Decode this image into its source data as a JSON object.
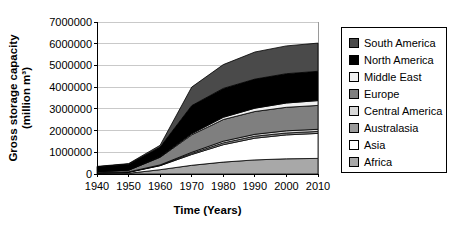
{
  "labels": {
    "y_title_line1": "Gross storage capacity",
    "y_title_line2": "(million m³)",
    "x_title": "Time (Years)"
  },
  "legend": {
    "position": "right",
    "items": [
      {
        "label": "South America",
        "color": "#4a4a4a"
      },
      {
        "label": "North America",
        "color": "#000000"
      },
      {
        "label": "Middle East",
        "color": "#f0f0f0"
      },
      {
        "label": "Europe",
        "color": "#7f7f7f"
      },
      {
        "label": "Central America",
        "color": "#d8d8d8"
      },
      {
        "label": "Australasia",
        "color": "#9a9a9a"
      },
      {
        "label": "Asia",
        "color": "#ffffff"
      },
      {
        "label": "Africa",
        "color": "#a8a8a8"
      }
    ]
  },
  "chart_data": {
    "type": "area",
    "stacked": true,
    "title": "",
    "xlabel": "Time (Years)",
    "ylabel": "Gross storage capacity (million m³)",
    "x": [
      1940,
      1950,
      1960,
      1970,
      1980,
      1990,
      2000,
      2010
    ],
    "ylim": [
      0,
      7000000
    ],
    "yticks": [
      0,
      1000000,
      2000000,
      3000000,
      4000000,
      5000000,
      6000000,
      7000000
    ],
    "grid": true,
    "gridline_color": "#c9c9c9",
    "band_outline_color": "#000000",
    "legend_position": "right",
    "series_order": "bottom-to-top",
    "series": [
      {
        "name": "Africa",
        "color": "#a8a8a8",
        "values": [
          20000,
          30000,
          200000,
          400000,
          550000,
          650000,
          700000,
          720000
        ]
      },
      {
        "name": "Asia",
        "color": "#ffffff",
        "values": [
          30000,
          50000,
          180000,
          500000,
          800000,
          1000000,
          1100000,
          1150000
        ]
      },
      {
        "name": "Australasia",
        "color": "#9a9a9a",
        "values": [
          5000,
          8000,
          20000,
          50000,
          80000,
          90000,
          90000,
          90000
        ]
      },
      {
        "name": "Central America",
        "color": "#d8d8d8",
        "values": [
          5000,
          8000,
          20000,
          50000,
          80000,
          90000,
          100000,
          100000
        ]
      },
      {
        "name": "Europe",
        "color": "#7f7f7f",
        "values": [
          50000,
          80000,
          350000,
          800000,
          1000000,
          1050000,
          1080000,
          1100000
        ]
      },
      {
        "name": "Middle East",
        "color": "#f0f0f0",
        "values": [
          0,
          5000,
          20000,
          50000,
          100000,
          150000,
          200000,
          220000
        ]
      },
      {
        "name": "North America",
        "color": "#000000",
        "values": [
          220000,
          270000,
          450000,
          1300000,
          1330000,
          1340000,
          1350000,
          1350000
        ]
      },
      {
        "name": "South America",
        "color": "#4a4a4a",
        "values": [
          20000,
          30000,
          80000,
          850000,
          1100000,
          1250000,
          1280000,
          1300000
        ]
      }
    ]
  }
}
